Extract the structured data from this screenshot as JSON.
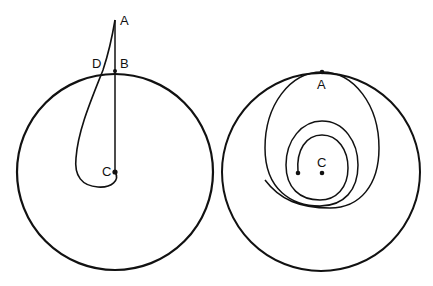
{
  "figure": {
    "left_panel": {
      "labels": {
        "A": "A",
        "B": "B",
        "C": "C",
        "D": "D"
      },
      "description": "Circle with radial line from center C to point A outside; curved path from C looping out through D toward A"
    },
    "right_panel": {
      "labels": {
        "A": "A",
        "C": "C"
      },
      "description": "Circle with spiral path starting near center C and expanding outward to touch the circle at A"
    },
    "colors": {
      "stroke": "#111111",
      "background": "#ffffff"
    }
  }
}
